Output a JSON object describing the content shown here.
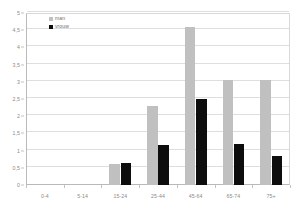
{
  "chart_data": {
    "type": "bar",
    "title": "",
    "subtitle": "",
    "xlabel": "",
    "ylabel": "",
    "grid": true,
    "legend_position": "top-left",
    "categories": [
      "0-4",
      "5-14",
      "15-24",
      "25-44",
      "45-64",
      "65-74",
      "75+"
    ],
    "series": [
      {
        "name": "man",
        "color": "#c0c0c0",
        "values": [
          0,
          0,
          0.6,
          2.3,
          4.6,
          3.05,
          3.05
        ]
      },
      {
        "name": "vrouw",
        "color": "#0d0d0d",
        "values": [
          0,
          0,
          0.65,
          1.15,
          2.5,
          1.2,
          0.85
        ]
      }
    ],
    "ylim": [
      0,
      5
    ],
    "y_ticks": [
      "0",
      "0,5",
      "1",
      "1,5",
      "2",
      "2,5",
      "3",
      "3,5",
      "4",
      "4,5",
      "5"
    ],
    "y_tick_values": [
      0,
      0.5,
      1,
      1.5,
      2,
      2.5,
      3,
      3.5,
      4,
      4.5,
      5
    ]
  },
  "legend": {
    "items": [
      {
        "label": "man",
        "color": "#c0c0c0"
      },
      {
        "label": "vrouw",
        "color": "#0d0d0d"
      }
    ]
  },
  "colors": {
    "man": "#c0c0c0",
    "vrouw": "#0d0d0d",
    "gridline": "#dedede",
    "axis": "#b9b9b9",
    "tick_text": "#8a8a8a"
  }
}
